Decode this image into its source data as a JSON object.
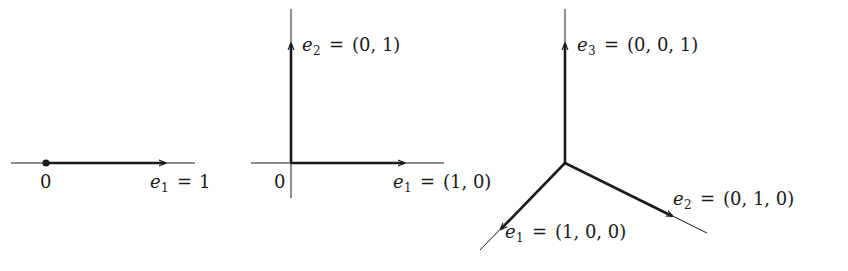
{
  "diagram": {
    "type": "standard basis vectors",
    "stroke_color": "#1a1a1a",
    "background": "#ffffff",
    "panels": [
      {
        "name": "1D",
        "origin_label": "0",
        "vectors": [
          {
            "symbol": "e",
            "index": "1",
            "value": "1"
          }
        ]
      },
      {
        "name": "2D",
        "origin_label": "0",
        "vectors": [
          {
            "symbol": "e",
            "index": "1",
            "value": "(1, 0)"
          },
          {
            "symbol": "e",
            "index": "2",
            "value": "(0, 1)"
          }
        ]
      },
      {
        "name": "3D",
        "vectors": [
          {
            "symbol": "e",
            "index": "1",
            "value": "(1, 0, 0)"
          },
          {
            "symbol": "e",
            "index": "2",
            "value": "(0, 1, 0)"
          },
          {
            "symbol": "e",
            "index": "3",
            "value": "(0, 0, 1)"
          }
        ]
      }
    ],
    "equals": "="
  }
}
